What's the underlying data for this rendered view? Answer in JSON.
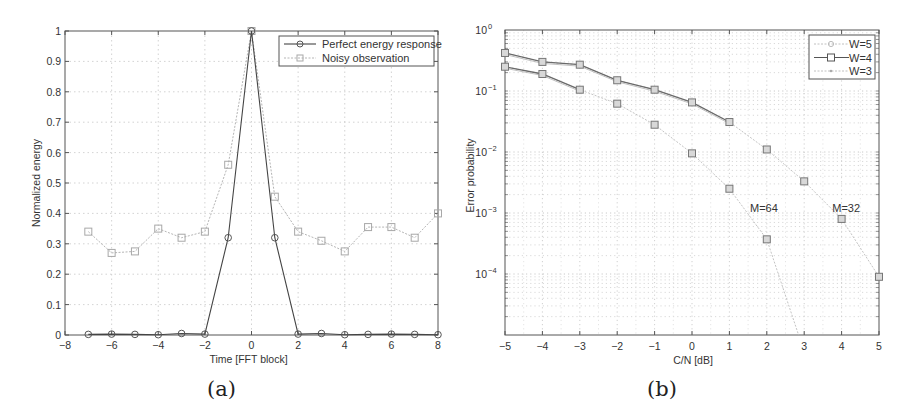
{
  "chart_data": [
    {
      "id": "a",
      "type": "line",
      "caption": "(a)",
      "title": "",
      "xlabel": "Time [FFT block]",
      "ylabel": "Normalized energy",
      "xlim": [
        -8,
        8
      ],
      "ylim": [
        0,
        1
      ],
      "xticks": [
        -8,
        -6,
        -4,
        -2,
        0,
        2,
        4,
        6,
        8
      ],
      "yticks": [
        0,
        0.1,
        0.2,
        0.3,
        0.4,
        0.5,
        0.6,
        0.7,
        0.8,
        0.9,
        1
      ],
      "ytick_labels": [
        "0",
        "0.1",
        "0.2",
        "0.3",
        "0.4",
        "0.5",
        "0.6",
        "0.7",
        "0.8",
        "0.9",
        "1"
      ],
      "xtick_labels": [
        "-8",
        "-6",
        "-4",
        "-2",
        "0",
        "2",
        "4",
        "6",
        "8"
      ],
      "grid": true,
      "legend_position": "upper right",
      "x": [
        -7,
        -6,
        -5,
        -4,
        -3,
        -2,
        -1,
        0,
        1,
        2,
        3,
        4,
        5,
        6,
        7,
        8
      ],
      "series": [
        {
          "name": "Perfect energy response",
          "marker": "circle",
          "color": "#333333",
          "values": [
            0.002,
            0.003,
            0.002,
            0.001,
            0.005,
            0.003,
            0.32,
            1.0,
            0.32,
            0.003,
            0.005,
            0.001,
            0.002,
            0.003,
            0.002,
            0.001
          ]
        },
        {
          "name": "Noisy observation",
          "marker": "square",
          "color": "#aaaaaa",
          "values": [
            0.34,
            0.27,
            0.275,
            0.35,
            0.32,
            0.34,
            0.56,
            1.0,
            0.455,
            0.34,
            0.31,
            0.275,
            0.355,
            0.355,
            0.32,
            0.4
          ]
        }
      ]
    },
    {
      "id": "b",
      "type": "line",
      "caption": "(b)",
      "title": "",
      "xlabel": "C/N [dB]",
      "ylabel": "Error probability",
      "yscale": "log",
      "xlim": [
        -5,
        5
      ],
      "ylim": [
        1e-05,
        1
      ],
      "xticks": [
        -5,
        -4,
        -3,
        -2,
        -1,
        0,
        1,
        2,
        3,
        4,
        5
      ],
      "xtick_labels": [
        "-5",
        "-4",
        "-3",
        "-2",
        "-1",
        "0",
        "1",
        "2",
        "3",
        "4",
        "5"
      ],
      "ytick_labels": [
        {
          "base": "10",
          "exp": "0"
        },
        {
          "base": "10",
          "exp": "-1"
        },
        {
          "base": "10",
          "exp": "-2"
        },
        {
          "base": "10",
          "exp": "-3"
        },
        {
          "base": "10",
          "exp": "-4"
        }
      ],
      "grid": true,
      "legend_position": "upper right",
      "legend": [
        {
          "name": "W=5",
          "marker": "circle",
          "color": "#bbbbbb"
        },
        {
          "name": "W=4",
          "marker": "square",
          "color": "#555555"
        },
        {
          "name": "W=3",
          "marker": "dot",
          "color": "#bbbbbb"
        }
      ],
      "annotations": [
        {
          "text": "M=64",
          "x": 1.55,
          "y": 0.0012
        },
        {
          "text": "M=32",
          "x": 3.75,
          "y": 0.0012
        }
      ],
      "series": [
        {
          "name": "M=32 (W=5/W=4/W=3 overlapping)",
          "marker": "square",
          "x": [
            -5,
            -4,
            -3,
            -2,
            -1,
            0,
            1,
            2,
            3,
            4,
            5
          ],
          "values": [
            0.42,
            0.3,
            0.27,
            0.15,
            0.105,
            0.065,
            0.031,
            0.011,
            0.0033,
            0.0008,
            9e-05
          ]
        },
        {
          "name": "M=64 (W=5/W=4/W=3 overlapping)",
          "marker": "square",
          "x": [
            -5,
            -4,
            -3,
            -2,
            -1,
            0,
            1,
            2,
            2.85
          ],
          "values": [
            0.25,
            0.19,
            0.105,
            0.062,
            0.028,
            0.0095,
            0.0025,
            0.00037,
            1e-05
          ]
        }
      ]
    }
  ]
}
